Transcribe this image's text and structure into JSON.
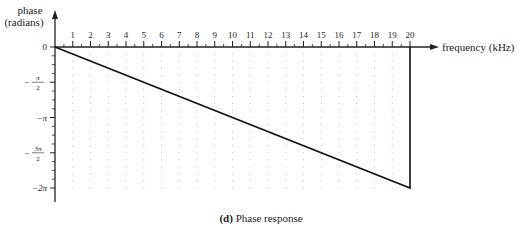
{
  "chart_data": {
    "type": "line",
    "title": "",
    "caption_label": "(d)",
    "caption_text": "Phase response",
    "xlabel": "frequency (kHz)",
    "ylabel_line1": "phase",
    "ylabel_line2": "(radians)",
    "x_ticks": [
      1,
      2,
      3,
      4,
      5,
      6,
      7,
      8,
      9,
      10,
      11,
      12,
      13,
      14,
      15,
      16,
      17,
      18,
      19,
      20
    ],
    "y_ticks": [
      {
        "value": 0,
        "label": "0"
      },
      {
        "value": -1.5708,
        "label": "-π/2"
      },
      {
        "value": -3.1416,
        "label": "-π"
      },
      {
        "value": -4.7124,
        "label": "-3π/2"
      },
      {
        "value": -6.2832,
        "label": "-2π"
      }
    ],
    "xlim": [
      0,
      20
    ],
    "ylim": [
      -6.2832,
      0
    ],
    "grid": "dotted",
    "series": [
      {
        "name": "phase",
        "x": [
          0,
          20,
          20
        ],
        "y": [
          0,
          -6.2832,
          0
        ]
      }
    ]
  }
}
